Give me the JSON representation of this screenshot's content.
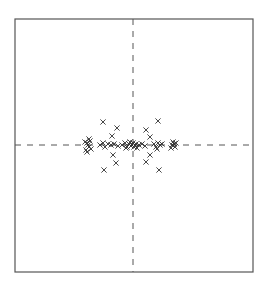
{
  "chart_data": {
    "type": "scatter",
    "title": "",
    "xlabel": "",
    "ylabel": "",
    "marker": "x",
    "marker_color": "#333333",
    "frame_color": "#555555",
    "axes_lines": {
      "style": "dashed",
      "x": 0,
      "y": 0
    },
    "grid": false,
    "legend": null,
    "xlim": [
      -11.8,
      12.0
    ],
    "ylim": [
      -12.7,
      12.6
    ],
    "frame_px": {
      "left": 15,
      "top": 19,
      "right": 253,
      "bottom": 272
    },
    "origin_px": {
      "x": 133,
      "y": 145
    },
    "px_per_unit": 10,
    "points": [
      {
        "x": -3.0,
        "y": 2.3
      },
      {
        "x": -1.6,
        "y": 1.7
      },
      {
        "x": -2.1,
        "y": 0.9
      },
      {
        "x": 2.5,
        "y": 2.4
      },
      {
        "x": 1.3,
        "y": 1.5
      },
      {
        "x": 1.7,
        "y": 0.8
      },
      {
        "x": -2.0,
        "y": -1.0
      },
      {
        "x": -1.7,
        "y": -1.8
      },
      {
        "x": -2.9,
        "y": -2.5
      },
      {
        "x": 1.7,
        "y": -1.0
      },
      {
        "x": 1.3,
        "y": -1.7
      },
      {
        "x": 2.6,
        "y": -2.5
      },
      {
        "x": -4.6,
        "y": 0.2
      },
      {
        "x": -4.4,
        "y": -0.2
      },
      {
        "x": -4.7,
        "y": -0.5
      },
      {
        "x": -4.3,
        "y": 0.4
      },
      {
        "x": -4.5,
        "y": 0.0
      },
      {
        "x": -4.8,
        "y": 0.3
      },
      {
        "x": -4.2,
        "y": -0.4
      },
      {
        "x": -4.4,
        "y": 0.6
      },
      {
        "x": -4.6,
        "y": -0.7
      },
      {
        "x": -3.3,
        "y": 0.0
      },
      {
        "x": -3.0,
        "y": 0.2
      },
      {
        "x": -2.8,
        "y": -0.2
      },
      {
        "x": -2.5,
        "y": 0.1
      },
      {
        "x": -2.2,
        "y": 0.0
      },
      {
        "x": -1.9,
        "y": 0.1
      },
      {
        "x": -1.5,
        "y": -0.1
      },
      {
        "x": -1.1,
        "y": 0.0
      },
      {
        "x": -0.8,
        "y": 0.2
      },
      {
        "x": -0.6,
        "y": -0.2
      },
      {
        "x": -0.4,
        "y": 0.1
      },
      {
        "x": -0.2,
        "y": -0.1
      },
      {
        "x": 0.0,
        "y": 0.2
      },
      {
        "x": 0.1,
        "y": -0.2
      },
      {
        "x": 0.3,
        "y": 0.1
      },
      {
        "x": 0.2,
        "y": 0.0
      },
      {
        "x": -0.1,
        "y": 0.0
      },
      {
        "x": -0.3,
        "y": 0.3
      },
      {
        "x": 0.4,
        "y": -0.3
      },
      {
        "x": -0.7,
        "y": -0.3
      },
      {
        "x": 0.6,
        "y": 0.0
      },
      {
        "x": 0.9,
        "y": 0.1
      },
      {
        "x": 1.2,
        "y": -0.1
      },
      {
        "x": 2.1,
        "y": 0.1
      },
      {
        "x": 2.3,
        "y": -0.2
      },
      {
        "x": 2.5,
        "y": 0.2
      },
      {
        "x": 2.7,
        "y": 0.0
      },
      {
        "x": 2.4,
        "y": -0.4
      },
      {
        "x": 2.9,
        "y": 0.1
      },
      {
        "x": 3.9,
        "y": 0.0
      },
      {
        "x": 4.0,
        "y": 0.3
      },
      {
        "x": 4.2,
        "y": -0.2
      },
      {
        "x": 3.8,
        "y": -0.3
      },
      {
        "x": 4.1,
        "y": 0.1
      },
      {
        "x": 4.3,
        "y": 0.2
      }
    ]
  }
}
